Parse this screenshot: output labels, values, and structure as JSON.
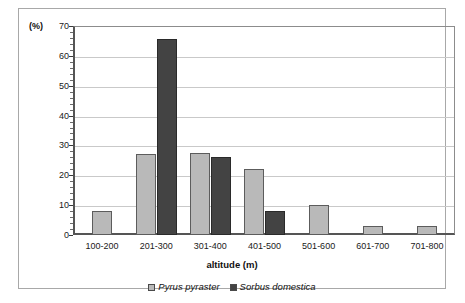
{
  "chart_data": {
    "type": "bar",
    "title": "",
    "xlabel": "altitude (m)",
    "ylabel": "(%)",
    "unit_label": "(%)",
    "categories": [
      "100-200",
      "201-300",
      "301-400",
      "401-500",
      "501-600",
      "601-700",
      "701-800"
    ],
    "series": [
      {
        "name": "Pyrus pyraster",
        "color": "#b9b9b9",
        "values": [
          8,
          27,
          27.5,
          22,
          10,
          3,
          3
        ]
      },
      {
        "name": "Sorbus domestica",
        "color": "#434343",
        "values": [
          0,
          65.5,
          26,
          8,
          0,
          0,
          0
        ]
      }
    ],
    "ylim": [
      0,
      70
    ],
    "ytick_values": [
      0,
      10,
      20,
      30,
      40,
      50,
      60,
      70
    ],
    "ytick_labels": [
      "0",
      "10",
      "20",
      "30",
      "40",
      "50",
      "60",
      "70"
    ],
    "yminor_step": 2,
    "grid": "horizontal",
    "legend_position": "bottom-center",
    "colors": {
      "series_light": "#b9b9b9",
      "series_dark": "#434343",
      "gridline": "#c9c9c9",
      "axis": "#555555",
      "frame": "#a8a8a8",
      "background": "#ffffff"
    }
  }
}
